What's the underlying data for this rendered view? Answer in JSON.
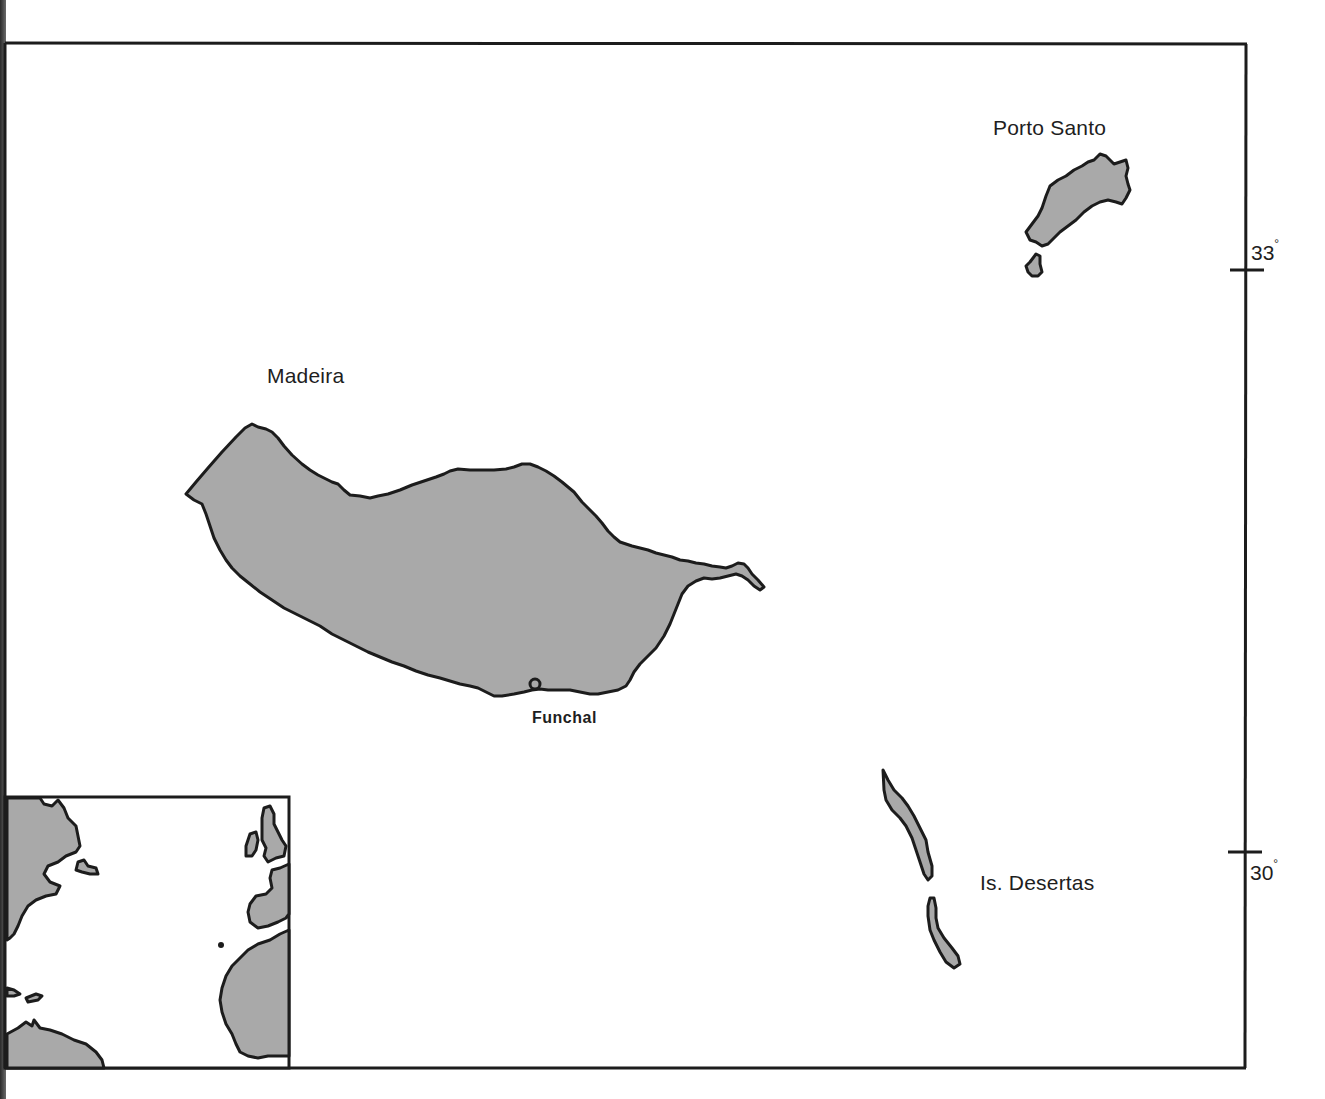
{
  "map": {
    "title": "Madeira archipelago",
    "colors": {
      "land": "#a9a9a9",
      "coast": "#1c1c1c",
      "sea": "#ffffff",
      "frame": "#1c1c1c"
    },
    "labels": {
      "madeira": "Madeira",
      "porto_santo": "Porto Santo",
      "desertas": "Is. Desertas",
      "funchal": "Funchal"
    },
    "latitude_ticks": [
      {
        "value": "33",
        "unit": "°"
      },
      {
        "value": "30",
        "unit": "°"
      }
    ],
    "inset": {
      "description": "North Atlantic locator map",
      "marker": "Madeira location dot"
    }
  }
}
